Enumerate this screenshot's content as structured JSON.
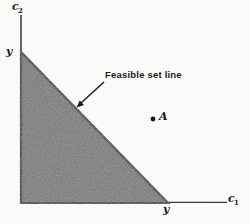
{
  "figure": {
    "colors": {
      "background": "#fbfbf9",
      "region_fill": "#6e6e6e",
      "line_color": "#161616",
      "axis_color": "#2c2c2c"
    },
    "labels": {
      "y_axis_var": "c",
      "y_axis_sub": "2",
      "x_axis_var": "c",
      "x_axis_sub": "1",
      "y_intercept_vertical": "y",
      "y_intercept_horizontal": "y",
      "feasible_line": "Feasible set line",
      "point_a": "A"
    }
  }
}
